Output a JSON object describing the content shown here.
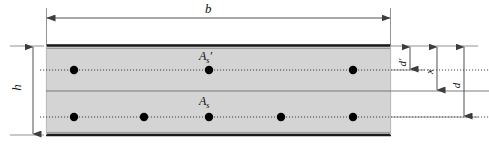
{
  "figure": {
    "type": "engineering-cross-section",
    "colors": {
      "concrete_fill": "#d4d4d4",
      "outline": "#1a1a1a",
      "dimension_line": "#555555",
      "rebar_dot": "#000000",
      "background": "#ffffff"
    },
    "section": {
      "x": 46,
      "y": 44,
      "width": 345,
      "height": 92
    },
    "dimensions": [
      {
        "name": "width",
        "label": "b",
        "orientation": "horizontal",
        "position": "top",
        "label_x": 208,
        "label_y": 6
      },
      {
        "name": "overall-depth",
        "label": "h",
        "orientation": "vertical",
        "position": "left",
        "label_x": 18,
        "label_y": 88
      },
      {
        "name": "compression-cover",
        "label": "d",
        "prime": true,
        "orientation": "vertical",
        "position": "right",
        "label_x": 404,
        "label_y": 62
      },
      {
        "name": "neutral-axis-depth",
        "label": "x",
        "orientation": "vertical",
        "position": "right",
        "label_x": 431,
        "label_y": 70
      },
      {
        "name": "effective-depth",
        "label": "d",
        "orientation": "vertical",
        "position": "right",
        "label_x": 458,
        "label_y": 84
      }
    ],
    "reinforcement": [
      {
        "name": "compression-steel",
        "label_base": "A",
        "label_sub": "s",
        "label_prime": "′",
        "label_x": 199,
        "label_y": 53,
        "row_y": 70,
        "dot_x": [
          74,
          209,
          353
        ],
        "dot_radius": 4.2
      },
      {
        "name": "tension-steel",
        "label_base": "A",
        "label_sub": "s",
        "label_prime": "",
        "label_x": 199,
        "label_y": 98,
        "row_y": 117,
        "dot_x": [
          74,
          144,
          209,
          281,
          353
        ],
        "dot_radius": 4.2
      }
    ],
    "neutral_axis": {
      "name": "neutral-axis",
      "y": 91
    }
  }
}
